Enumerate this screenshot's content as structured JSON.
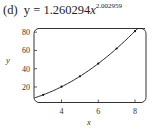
{
  "figure": {
    "label": "(d)",
    "equation_lhs": "y = 1.260294",
    "equation_var": "x",
    "equation_exponent": "2.002959"
  },
  "chart_data": {
    "type": "scatter",
    "xlabel": "x",
    "ylabel": "y",
    "x_ticks": [
      4,
      6,
      8
    ],
    "y_ticks": [
      20,
      40,
      60,
      80
    ],
    "xlim": [
      2.5,
      8.6
    ],
    "ylim": [
      3,
      84
    ],
    "grid": false,
    "legend": null,
    "series": [
      {
        "name": "data points",
        "x": [
          3,
          4,
          5,
          6,
          7,
          8
        ],
        "y": [
          11.4,
          20.3,
          31.7,
          45.6,
          62.1,
          81.1
        ]
      },
      {
        "name": "fitted curve y = 1.260294x^2.002959",
        "type": "line",
        "a": 1.260294,
        "b": 2.002959
      }
    ]
  }
}
